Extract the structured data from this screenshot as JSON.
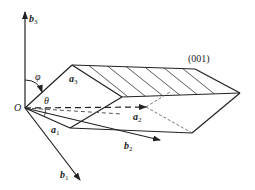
{
  "diagram": {
    "origin_label": "O",
    "plane_label": "(001)",
    "vectors": {
      "a1": {
        "label": "a",
        "sub": "1"
      },
      "a2": {
        "label": "a",
        "sub": "2"
      },
      "a3": {
        "label": "a",
        "sub": "3"
      },
      "b1": {
        "label": "b",
        "sub": "1"
      },
      "b2": {
        "label": "b",
        "sub": "2"
      },
      "b3": {
        "label": "b",
        "sub": "3"
      }
    },
    "angles": {
      "phi": "φ",
      "theta": "θ"
    },
    "colors": {
      "line": "#222222",
      "hidden": "#555555",
      "background": "#ffffff"
    }
  }
}
